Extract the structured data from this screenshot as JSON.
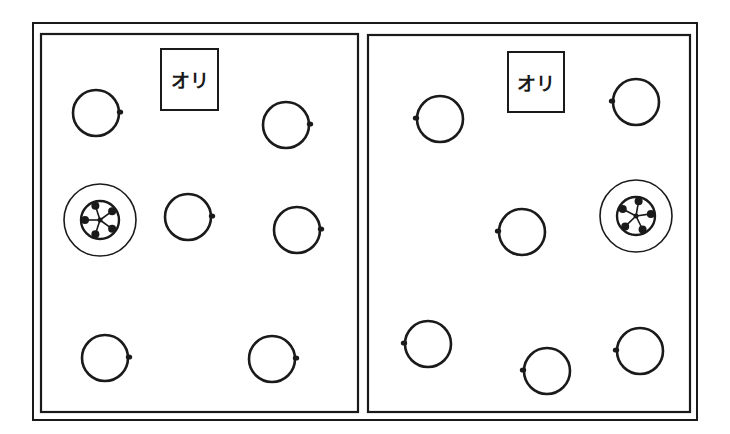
{
  "diagram": {
    "ink_color": "#1a1a1a",
    "background": "#ffffff",
    "outer_frame": {
      "x": 33,
      "y": 23,
      "w": 664,
      "h": 397
    },
    "panels": [
      {
        "id": "left",
        "rect": {
          "x": 41,
          "y": 34,
          "w": 317,
          "h": 378
        },
        "label": {
          "text": "オリ",
          "x": 160,
          "y": 48,
          "w": 59,
          "h": 63
        },
        "circles": [
          {
            "cx": 96,
            "cy": 113,
            "r": 23,
            "knob": "right"
          },
          {
            "cx": 286,
            "cy": 125,
            "r": 23,
            "knob": "right"
          },
          {
            "cx": 188,
            "cy": 217,
            "r": 23,
            "knob": "right"
          },
          {
            "cx": 297,
            "cy": 230,
            "r": 23,
            "knob": "right"
          },
          {
            "cx": 105,
            "cy": 358,
            "r": 23,
            "knob": "right"
          },
          {
            "cx": 272,
            "cy": 359,
            "r": 23,
            "knob": "right"
          }
        ],
        "special": {
          "cx": 100,
          "cy": 220,
          "outer_r": 36,
          "inner_r": 19,
          "spokes": 5,
          "rotation": -18
        }
      },
      {
        "id": "right",
        "rect": {
          "x": 368,
          "y": 35,
          "w": 322,
          "h": 377
        },
        "label": {
          "text": "オリ",
          "x": 507,
          "y": 51,
          "w": 58,
          "h": 62
        },
        "circles": [
          {
            "cx": 440,
            "cy": 119,
            "r": 23,
            "knob": "left"
          },
          {
            "cx": 636,
            "cy": 102,
            "r": 23,
            "knob": "left"
          },
          {
            "cx": 522,
            "cy": 232,
            "r": 23,
            "knob": "left"
          },
          {
            "cx": 428,
            "cy": 344,
            "r": 23,
            "knob": "left"
          },
          {
            "cx": 547,
            "cy": 371,
            "r": 23,
            "knob": "left"
          },
          {
            "cx": 640,
            "cy": 351,
            "r": 23,
            "knob": "left"
          }
        ],
        "special": {
          "cx": 636,
          "cy": 216,
          "outer_r": 36,
          "inner_r": 19,
          "spokes": 5,
          "rotation": 10
        }
      }
    ]
  }
}
